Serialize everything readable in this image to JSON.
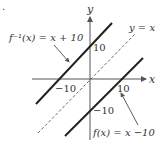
{
  "figure": {
    "bullet": ".",
    "axes": {
      "x_label": "x",
      "y_label": "y",
      "x_ticks": [
        "−10",
        "10"
      ],
      "y_ticks": [
        "10",
        "−10"
      ]
    },
    "lines": [
      {
        "id": "inverse",
        "label": "f⁻¹(x) = x + 10",
        "style": "solid-thick"
      },
      {
        "id": "identity",
        "label": "y = x",
        "style": "dashed"
      },
      {
        "id": "function",
        "label": "f(x) = x − 10",
        "style": "solid-thick"
      }
    ],
    "labels": {
      "inverse": "f⁻¹(x) = x + 10",
      "identity": "y = x",
      "function": "f(x) = x −10"
    },
    "colors": {
      "axis": "#555555",
      "line": "#222222",
      "text": "#333333"
    }
  }
}
